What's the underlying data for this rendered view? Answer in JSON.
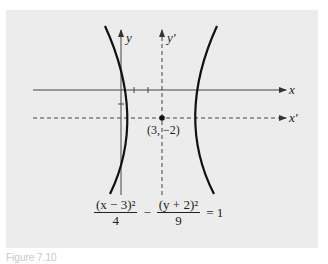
{
  "figure": {
    "axes": {
      "x_label": "x",
      "y_label": "y",
      "x_prime_label": "x′",
      "y_prime_label": "y′"
    },
    "center_label": "(3, −2)",
    "equation": {
      "term1_numerator": "(x − 3)²",
      "term1_denominator": "4",
      "operator": "−",
      "term2_numerator": "(y + 2)²",
      "term2_denominator": "9",
      "rhs": "= 1"
    },
    "caption": "Figure 7.10"
  }
}
